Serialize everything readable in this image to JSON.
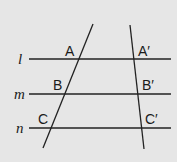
{
  "colors": {
    "background": "#e6e6e6",
    "stroke": "#222222",
    "text": "#1a1a1a"
  },
  "parallel_lines": [
    {
      "name": "l",
      "label": "l",
      "y": 59,
      "x1": 29,
      "x2": 171
    },
    {
      "name": "m",
      "label": "m",
      "y": 94,
      "x1": 29,
      "x2": 171
    },
    {
      "name": "n",
      "label": "n",
      "y": 128,
      "x1": 29,
      "x2": 171
    }
  ],
  "transversals": [
    {
      "name": "left",
      "x1": 93,
      "y1": 24,
      "x2": 43,
      "y2": 148
    },
    {
      "name": "right",
      "x1": 130,
      "y1": 25,
      "x2": 144,
      "y2": 149
    }
  ],
  "points": [
    {
      "label": "A",
      "x": 65,
      "y": 56
    },
    {
      "label": "B",
      "x": 53,
      "y": 90
    },
    {
      "label": "C",
      "x": 38,
      "y": 124
    },
    {
      "label": "A′",
      "x": 138,
      "y": 56
    },
    {
      "label": "B′",
      "x": 142,
      "y": 90
    },
    {
      "label": "C′",
      "x": 145,
      "y": 124
    }
  ]
}
